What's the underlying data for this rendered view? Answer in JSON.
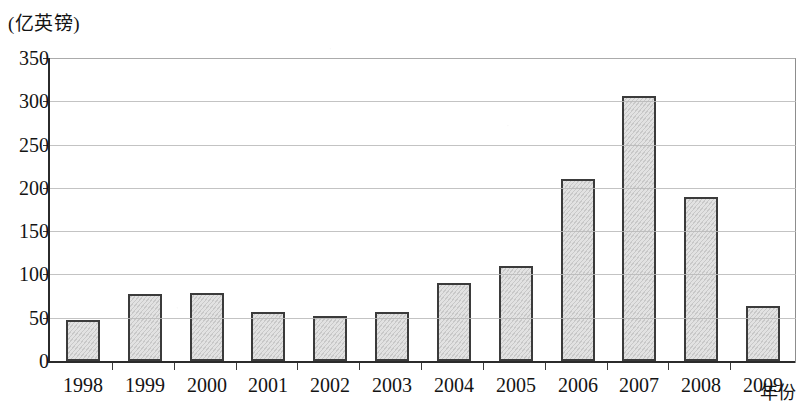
{
  "chart_data": {
    "type": "bar",
    "title": "",
    "subtitle": "",
    "unit_caption": "(亿英镑)",
    "xlabel": "年份",
    "ylabel": "",
    "categories": [
      "1998",
      "1999",
      "2000",
      "2001",
      "2002",
      "2003",
      "2004",
      "2005",
      "2006",
      "2007",
      "2008",
      "2009"
    ],
    "values": [
      47,
      77,
      78,
      57,
      52,
      57,
      90,
      110,
      210,
      306,
      190,
      63
    ],
    "ylim": [
      0,
      350
    ],
    "ytick_labels": [
      "0",
      "50",
      "100",
      "150",
      "200",
      "250",
      "300",
      "350"
    ],
    "ytick_values": [
      0,
      50,
      100,
      150,
      200,
      250,
      300,
      350
    ],
    "grid": true,
    "legend": "none",
    "bar_fill_color": "#e2e2e2",
    "bar_border_color": "#3b3b3b",
    "gridline_color": "#b9b9b9",
    "axis_color": "#2b2b2b"
  }
}
